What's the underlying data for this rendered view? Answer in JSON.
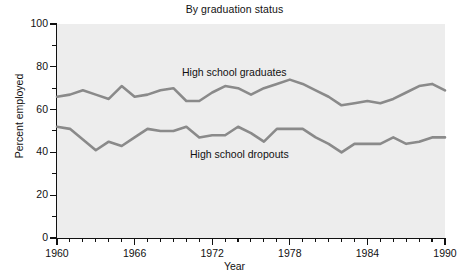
{
  "chart_data": {
    "type": "line",
    "title": "By graduation status",
    "xlabel": "Year",
    "ylabel": "Percent employed",
    "xlim": [
      1960,
      1990
    ],
    "ylim": [
      0,
      100
    ],
    "grid": false,
    "legend_position": "inline-annotation",
    "x_ticks_major": [
      "1960",
      "1966",
      "1972",
      "1978",
      "1984",
      "1990"
    ],
    "x_tick_major_values": [
      1960,
      1966,
      1972,
      1978,
      1984,
      1990
    ],
    "x_tick_minor_step": 1,
    "y_ticks_major": [
      "0",
      "20",
      "40",
      "60",
      "80",
      "100"
    ],
    "y_tick_major_values": [
      0,
      20,
      40,
      60,
      80,
      100
    ],
    "y_tick_minor_step": 10,
    "x": [
      1960,
      1961,
      1962,
      1963,
      1964,
      1965,
      1966,
      1967,
      1968,
      1969,
      1970,
      1971,
      1972,
      1973,
      1974,
      1975,
      1976,
      1977,
      1978,
      1979,
      1980,
      1981,
      1982,
      1983,
      1984,
      1985,
      1986,
      1987,
      1988,
      1989,
      1990
    ],
    "series": [
      {
        "name": "High school graduates",
        "color": "#8a8a8a",
        "values": [
          66,
          67,
          69,
          67,
          65,
          71,
          66,
          67,
          69,
          70,
          64,
          64,
          68,
          71,
          70,
          67,
          70,
          72,
          74,
          72,
          69,
          66,
          62,
          63,
          64,
          63,
          65,
          68,
          71,
          72,
          69
        ]
      },
      {
        "name": "High school dropouts",
        "color": "#8a8a8a",
        "values": [
          52,
          51,
          46,
          41,
          45,
          43,
          47,
          51,
          50,
          50,
          52,
          47,
          48,
          48,
          52,
          49,
          45,
          51,
          51,
          51,
          47,
          44,
          40,
          44,
          44,
          44,
          47,
          44,
          45,
          47,
          47
        ]
      }
    ],
    "annotations": [
      {
        "text": "High school graduates",
        "near_series": "High school graduates"
      },
      {
        "text": "High school dropouts",
        "near_series": "High school dropouts"
      }
    ]
  },
  "style": {
    "plot_background": "#ededed",
    "axis_color": "#111111",
    "page_background": "#ffffff"
  }
}
